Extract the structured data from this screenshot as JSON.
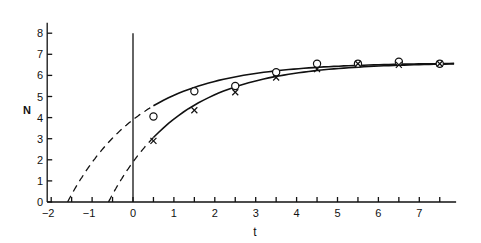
{
  "chart_data": {
    "type": "line",
    "title": "",
    "xlabel": "t",
    "ylabel": "N",
    "xlim": [
      -2,
      7.9
    ],
    "ylim": [
      0,
      8.5
    ],
    "grid": false,
    "legend": null,
    "x_ticks": [
      -2,
      -1,
      0,
      1,
      2,
      3,
      4,
      5,
      6,
      7
    ],
    "x_minor_ticks": [
      -1.5,
      -0.5,
      0.5,
      1.5,
      2.5,
      3.5,
      4.5,
      5.5,
      6.5,
      7.5
    ],
    "y_ticks": [
      0,
      1,
      2,
      3,
      4,
      5,
      6,
      7,
      8
    ],
    "vertical_reference_line_at_t": 0,
    "series": [
      {
        "name": "circles",
        "marker": "o",
        "x": [
          0.5,
          1.5,
          2.5,
          3.5,
          4.5,
          5.5,
          6.5,
          7.5
        ],
        "values": [
          4.05,
          5.25,
          5.5,
          6.15,
          6.55,
          6.55,
          6.65,
          6.55
        ]
      },
      {
        "name": "crosses",
        "marker": "x",
        "x": [
          0.5,
          1.5,
          2.5,
          3.5,
          4.5,
          5.5,
          6.5,
          7.5
        ],
        "values": [
          2.9,
          4.35,
          5.2,
          5.9,
          6.3,
          6.55,
          6.5,
          6.55
        ]
      }
    ],
    "fitted_curves": [
      {
        "name": "upper-fit",
        "solid_from_t": 0.5,
        "dashed_extrapolation_to_t": -1.6,
        "value_at_t0": 3.9,
        "asymptote": 6.6
      },
      {
        "name": "lower-fit",
        "solid_from_t": 0.5,
        "dashed_extrapolation_to_t": -0.6,
        "value_at_t0": 1.9,
        "asymptote": 6.6
      }
    ]
  },
  "labels": {
    "xlabel": "t",
    "ylabel": "N",
    "xticks": [
      "−2",
      "−1",
      "0",
      "1",
      "2",
      "3",
      "4",
      "5",
      "6",
      "7"
    ],
    "yticks": [
      "0",
      "1",
      "2",
      "3",
      "4",
      "5",
      "6",
      "7",
      "8"
    ]
  }
}
